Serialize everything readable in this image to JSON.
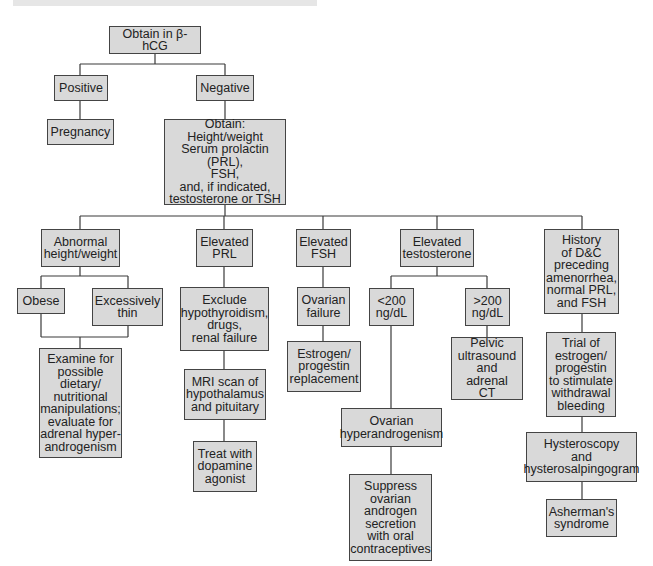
{
  "colors": {
    "box_fill": "#d9d9d9",
    "box_border": "#444444",
    "line": "#3a3a3a",
    "text": "#222222"
  },
  "nodes": {
    "root": "Obtain in β-hCG",
    "positive": "Positive",
    "negative": "Negative",
    "pregnancy": "Pregnancy",
    "obtain_tests": "Obtain:\nHeight/weight\nSerum prolactin (PRL),\nFSH,\nand, if indicated,\ntestosterone or TSH",
    "abnormal_hw": "Abnormal\nheight/weight",
    "elevated_prl": "Elevated\nPRL",
    "elevated_fsh": "Elevated\nFSH",
    "elevated_testosterone": "Elevated\ntestosterone",
    "history_dc": "History\nof D&C\npreceding\namenorrhea,\nnormal PRL,\nand FSH",
    "obese": "Obese",
    "excessively_thin": "Excessively\nthin",
    "examine_dietary": "Examine for\npossible\ndietary/\nnutritional\nmanipulations;\nevaluate for\nadrenal hyper-\nandrogenism",
    "exclude_hypothyroid": "Exclude\nhypothyroidism,\ndrugs,\nrenal failure",
    "mri_scan": "MRI scan of\nhypothalamus\nand pituitary",
    "dopamine_agonist": "Treat with\ndopamine\nagonist",
    "ovarian_failure": "Ovarian\nfailure",
    "estrogen_replacement": "Estrogen/\nprogestin\nreplacement",
    "lt200": "<200\nng/dL",
    "gt200": ">200\nng/dL",
    "pelvic_us": "Pelvic\nultrasound\nand adrenal\nCT",
    "ovarian_hyperandrogenism": "Ovarian\nhyperandrogenism",
    "suppress_ocp": "Suppress\novarian\nandrogen\nsecretion\nwith oral\ncontraceptives",
    "trial_estrogen": "Trial of\nestrogen/\nprogestin\nto stimulate\nwithdrawal\nbleeding",
    "hysteroscopy": "Hysteroscopy\nand\nhysterosalpingogram",
    "ashermans": "Asherman's\nsyndrome"
  }
}
